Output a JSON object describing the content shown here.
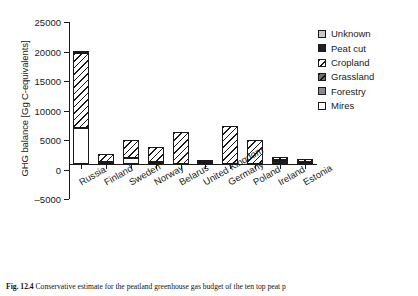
{
  "chart_data": {
    "type": "bar",
    "title": "",
    "xlabel": "",
    "ylabel": "GHG balance [Gg C-equivalents]",
    "ylim": [
      -5000,
      25000
    ],
    "ytick_values": [
      25000,
      20000,
      15000,
      10000,
      5000,
      0,
      -5000
    ],
    "ytick_labels": [
      "25000",
      "20000",
      "15000",
      "10000",
      "5000",
      "0",
      "–5000"
    ],
    "grid": false,
    "legend_position": "top-right",
    "categories": [
      "Russia",
      "Finland",
      "Sweden",
      "Norway",
      "Belarus",
      "United Kingdom",
      "Germany",
      "Poland",
      "Ireland",
      "Estonia"
    ],
    "stack_order": [
      "Mires",
      "Peat cut",
      "Forestry",
      "Grassland",
      "Cropland",
      "Unknown"
    ],
    "series": [
      {
        "name": "Mires",
        "key": "mires",
        "values": [
          6000,
          0,
          900,
          0,
          0,
          0,
          0,
          0,
          0,
          0
        ]
      },
      {
        "name": "Peat cut",
        "key": "peatcut",
        "values": [
          0,
          0,
          0,
          0,
          0,
          350,
          0,
          0,
          500,
          0
        ]
      },
      {
        "name": "Forestry",
        "key": "forestry",
        "values": [
          0,
          0,
          0,
          0,
          0,
          0,
          0,
          0,
          0,
          0
        ]
      },
      {
        "name": "Grassland",
        "key": "grassland",
        "values": [
          0,
          200,
          0,
          300,
          0,
          0,
          0,
          0,
          120,
          300
        ]
      },
      {
        "name": "Cropland",
        "key": "cropland",
        "values": [
          12700,
          1400,
          3100,
          2600,
          5300,
          250,
          6400,
          4000,
          480,
          500
        ]
      },
      {
        "name": "Unknown",
        "key": "unknown",
        "values": [
          400,
          0,
          0,
          0,
          0,
          0,
          0,
          0,
          0,
          0
        ]
      }
    ],
    "totals": [
      19100,
      1600,
      4000,
      2900,
      5300,
      600,
      6400,
      4000,
      1100,
      800
    ]
  },
  "legend": {
    "items": [
      {
        "label": "Unknown",
        "key": "unknown"
      },
      {
        "label": "Peat cut",
        "key": "peatcut"
      },
      {
        "label": "Cropland",
        "key": "cropland"
      },
      {
        "label": "Grassland",
        "key": "grassland"
      },
      {
        "label": "Forestry",
        "key": "forestry"
      },
      {
        "label": "Mires",
        "key": "mires"
      }
    ]
  },
  "caption": {
    "number": "Fig. 12.4",
    "text": "Conservative estimate for the peatland greenhouse gas budget of the ten top peat p"
  }
}
